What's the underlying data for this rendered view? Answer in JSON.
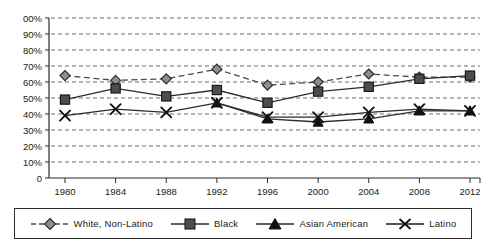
{
  "chart_data": {
    "type": "line",
    "title": "",
    "xlabel": "",
    "ylabel": "",
    "categories": [
      "1980",
      "1984",
      "1988",
      "1992",
      "1996",
      "2000",
      "2004",
      "2008",
      "2012"
    ],
    "x": [
      1980,
      1984,
      1988,
      1992,
      1996,
      2000,
      2004,
      2008,
      2012
    ],
    "ylim": [
      0,
      100
    ],
    "ytick_labels": [
      "00%",
      "90%",
      "80%",
      "70%",
      "60%",
      "50%",
      "40%",
      "30%",
      "20%",
      "10%",
      "0"
    ],
    "ytick_values": [
      100,
      90,
      80,
      70,
      60,
      50,
      40,
      30,
      20,
      10,
      0
    ],
    "grid": "horizontal-dashed",
    "legend_position": "bottom",
    "series": [
      {
        "name": "White, Non-Latino",
        "marker": "diamond",
        "line": "dashed",
        "color": "#8c8c8c",
        "values": [
          64,
          61,
          62,
          68,
          58,
          60,
          65,
          63,
          63
        ]
      },
      {
        "name": "Black",
        "marker": "square",
        "line": "solid",
        "color": "#4d4d4d",
        "values": [
          49,
          56,
          51,
          55,
          47,
          54,
          57,
          62,
          64
        ]
      },
      {
        "name": "Asian American",
        "marker": "triangle",
        "line": "solid",
        "color": "#111111",
        "values": [
          null,
          null,
          null,
          47,
          37,
          35,
          37,
          42,
          42
        ]
      },
      {
        "name": "Latino",
        "marker": "cross",
        "line": "solid",
        "color": "#111111",
        "values": [
          39,
          43,
          41,
          47,
          38,
          38,
          41,
          43,
          42
        ]
      }
    ]
  },
  "legend": {
    "items": [
      {
        "label": "White,  Non-Latino",
        "key": "diamond-dashed-key"
      },
      {
        "label": "Black",
        "key": "square-solid-key"
      },
      {
        "label": "Asian  American",
        "key": "triangle-solid-key"
      },
      {
        "label": "Latino",
        "key": "cross-solid-key"
      }
    ]
  }
}
